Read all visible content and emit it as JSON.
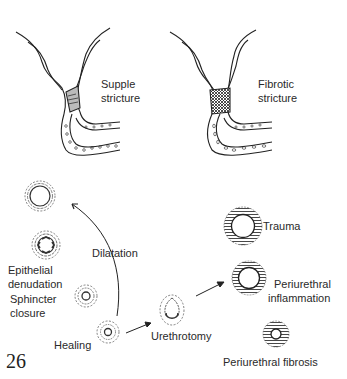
{
  "page_number": "26",
  "top_panels": {
    "left": {
      "label_line1": "Supple",
      "label_line2": "stricture"
    },
    "right": {
      "label_line1": "Fibrotic",
      "label_line2": "stricture"
    }
  },
  "left_sequence": {
    "dilatation": "Dilatation",
    "epithelial_line1": "Epithelial",
    "epithelial_line2": "denudation",
    "sphincter_line1": "Sphincter",
    "sphincter_line2": "closure",
    "healing": "Healing"
  },
  "middle": {
    "urethrotomy": "Urethrotomy"
  },
  "right_sequence": {
    "trauma": "Trauma",
    "periurethral_inflammation_line1": "Periurethral",
    "periurethral_inflammation_line2": "inflammation",
    "periurethral_fibrosis": "Periurethral fibrosis"
  }
}
